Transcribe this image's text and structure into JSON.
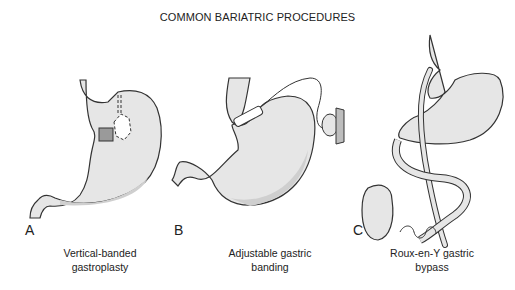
{
  "title": "COMMON BARIATRIC PROCEDURES",
  "panels": [
    {
      "letter": "A",
      "caption_line1": "Vertical-banded",
      "caption_line2": "gastroplasty"
    },
    {
      "letter": "B",
      "caption_line1": "Adjustable gastric",
      "caption_line2": "banding"
    },
    {
      "letter": "C",
      "caption_line1": "Roux-en-Y gastric",
      "caption_line2": "bypass"
    }
  ],
  "colors": {
    "stomach_fill": "#e6e6e6",
    "shade": "#cfcfcf",
    "outline": "#333333",
    "band": "#9a9a9a"
  }
}
